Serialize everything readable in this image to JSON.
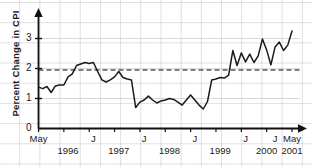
{
  "chart_data": {
    "type": "line",
    "title": "",
    "xlabel": "",
    "ylabel": "Percent Change in CPI",
    "ylim": [
      0,
      4
    ],
    "yticks": [
      0,
      1,
      2,
      3
    ],
    "ytick_labels": [
      "0",
      "1",
      "2",
      "3"
    ],
    "grid": true,
    "legend": "none",
    "x_start": "May 1996",
    "x_end": "May 2001",
    "x_frequency": "monthly",
    "x_major_labels": [
      "May",
      "J",
      "J",
      "J",
      "J",
      "J",
      "May"
    ],
    "x_year_labels": [
      "1996",
      "1997",
      "1998",
      "1999",
      "2000",
      "2001"
    ],
    "reference_line": {
      "value": 1.95,
      "style": "dashed",
      "color": "#555555",
      "label": ""
    },
    "series": [
      {
        "name": "Percent Change in CPI",
        "color": "#1a1a1a",
        "x": [
          "1996-05",
          "1996-06",
          "1996-07",
          "1996-08",
          "1996-09",
          "1996-10",
          "1996-11",
          "1996-12",
          "1997-01",
          "1997-02",
          "1997-03",
          "1997-04",
          "1997-05",
          "1997-06",
          "1997-07",
          "1997-08",
          "1997-09",
          "1997-10",
          "1997-11",
          "1997-12",
          "1998-01",
          "1998-02",
          "1998-03",
          "1998-04",
          "1998-05",
          "1998-06",
          "1998-07",
          "1998-08",
          "1998-09",
          "1998-10",
          "1998-11",
          "1998-12",
          "1999-01",
          "1999-02",
          "1999-03",
          "1999-04",
          "1999-05",
          "1999-06",
          "1999-07",
          "1999-08",
          "1999-09",
          "1999-10",
          "1999-11",
          "1999-12",
          "2000-01",
          "2000-02",
          "2000-03",
          "2000-04",
          "2000-05",
          "2000-06",
          "2000-07",
          "2000-08",
          "2000-09",
          "2000-10",
          "2000-11",
          "2000-12",
          "2001-01",
          "2001-02",
          "2001-03",
          "2001-04",
          "2001-05"
        ],
        "values": [
          1.38,
          1.33,
          1.4,
          1.2,
          1.42,
          1.45,
          1.45,
          1.72,
          1.82,
          2.1,
          2.15,
          2.2,
          2.17,
          2.2,
          1.9,
          1.62,
          1.55,
          1.62,
          1.72,
          1.9,
          1.7,
          1.65,
          1.62,
          0.7,
          0.88,
          0.95,
          1.08,
          0.95,
          0.85,
          0.92,
          0.95,
          1.0,
          0.97,
          0.88,
          0.78,
          0.95,
          1.12,
          0.95,
          0.78,
          0.65,
          0.9,
          1.62,
          1.65,
          1.7,
          1.68,
          1.78,
          2.6,
          2.1,
          2.52,
          2.22,
          2.48,
          2.2,
          2.42,
          2.98,
          2.62,
          2.12,
          2.72,
          2.88,
          2.6,
          2.78,
          3.25
        ]
      }
    ]
  }
}
